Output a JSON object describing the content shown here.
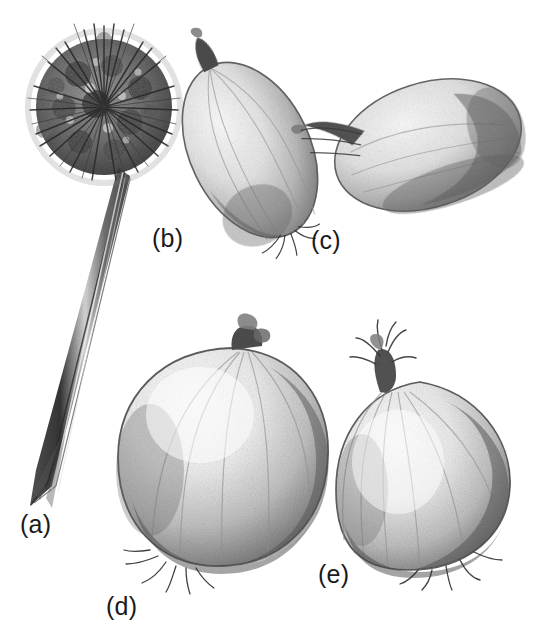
{
  "plate": {
    "title": "Allium cepa — inflorescence and bulb forms",
    "medium": "graphite pencil drawing",
    "background_color": "#ffffff",
    "ink_color": "#1a1a1a",
    "width": 548,
    "height": 635
  },
  "labels": {
    "a": "(a)",
    "b": "(b)",
    "c": "(c)",
    "d": "(d)",
    "e": "(e)"
  },
  "figures": [
    {
      "key": "a",
      "label": "(a)",
      "subject": "inflorescence",
      "description": "dense spherical umbel of many small flowers on a long tapering hollow scape angled down to the lower left",
      "head_shape": "globose",
      "head_center": [
        104,
        107
      ],
      "head_radius": 72,
      "stalk_from": [
        112,
        175
      ],
      "stalk_to": [
        30,
        505
      ],
      "label_position": [
        20,
        512
      ]
    },
    {
      "key": "b",
      "label": "(b)",
      "subject": "bulb",
      "description": "narrow elongate ovoid bulb tilted to the left, pointed dried neck at upper right, small root tuft at lower left",
      "bulb_shape": "elongate-ovoid",
      "center": [
        250,
        150
      ],
      "width": 120,
      "height": 185,
      "rotation_deg": -28,
      "label_position": [
        152,
        226
      ]
    },
    {
      "key": "c",
      "label": "(c)",
      "subject": "bulb",
      "description": "flattened oblate bulb lying on its side, curved dried neck projecting to the upper left",
      "bulb_shape": "flattened-oblate",
      "center": [
        425,
        145
      ],
      "width": 195,
      "height": 120,
      "rotation_deg": -20,
      "label_position": [
        311,
        228
      ]
    },
    {
      "key": "d",
      "label": "(d)",
      "subject": "bulb",
      "description": "large round globose bulb standing upright, short dried neck at the top, root tuft at the base",
      "bulb_shape": "globose",
      "center": [
        218,
        455
      ],
      "width": 200,
      "height": 215,
      "rotation_deg": 0,
      "label_position": [
        106,
        594
      ]
    },
    {
      "key": "e",
      "label": "(e)",
      "subject": "bulb",
      "description": "broad flattened-globe bulb with a prominent shaggy dried neck leaning to the left and roots at the base",
      "bulb_shape": "flattened-globe",
      "center": [
        425,
        470
      ],
      "width": 185,
      "height": 175,
      "rotation_deg": 8,
      "label_position": [
        318,
        562
      ]
    }
  ]
}
